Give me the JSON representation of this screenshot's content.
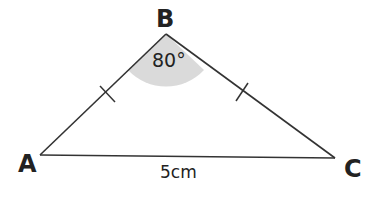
{
  "diagram": {
    "type": "isosceles-triangle",
    "vertices": {
      "A": {
        "label": "A"
      },
      "B": {
        "label": "B"
      },
      "C": {
        "label": "C"
      }
    },
    "angle_B": "80°",
    "base_length": "5cm",
    "equal_sides": [
      "AB",
      "BC"
    ],
    "colors": {
      "line": "#333333",
      "angle_fill": "#d9d9d9"
    }
  }
}
